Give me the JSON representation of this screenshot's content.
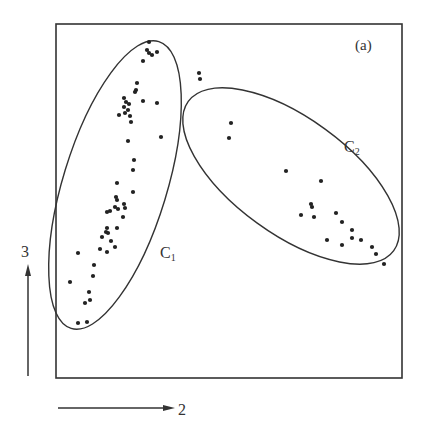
{
  "chart_data": {
    "type": "scatter",
    "title": "",
    "panel_label": "(a)",
    "xlabel": "2",
    "ylabel": "3",
    "axis_style": "arrows outside frame, no ticks",
    "grid": false,
    "legend": null,
    "frame": {
      "left": 56,
      "top": 24,
      "right": 402,
      "bottom": 378
    },
    "clusters": [
      {
        "name": "C₁",
        "label_main": "C",
        "label_sub": "1",
        "label_pos": [
          160,
          258
        ],
        "ellipse": {
          "cx": 115,
          "cy": 185,
          "rx": 52,
          "ry": 150,
          "rotate": 17
        },
        "points": [
          [
            149,
            42
          ],
          [
            147,
            50
          ],
          [
            149,
            53
          ],
          [
            152,
            55
          ],
          [
            157,
            52
          ],
          [
            143,
            61
          ],
          [
            137,
            83
          ],
          [
            136,
            90
          ],
          [
            135,
            92
          ],
          [
            124,
            98
          ],
          [
            126,
            102
          ],
          [
            129,
            104
          ],
          [
            124,
            107
          ],
          [
            128,
            110
          ],
          [
            125,
            113
          ],
          [
            119,
            115
          ],
          [
            130,
            116
          ],
          [
            143,
            101
          ],
          [
            157,
            103
          ],
          [
            131,
            122
          ],
          [
            161,
            137
          ],
          [
            128,
            141
          ],
          [
            134,
            160
          ],
          [
            133,
            170
          ],
          [
            117,
            183
          ],
          [
            133,
            192
          ],
          [
            116,
            197
          ],
          [
            117,
            200
          ],
          [
            115,
            207
          ],
          [
            107,
            212
          ],
          [
            110,
            211
          ],
          [
            118,
            209
          ],
          [
            124,
            204
          ],
          [
            125,
            208
          ],
          [
            123,
            217
          ],
          [
            107,
            228
          ],
          [
            106,
            232
          ],
          [
            102,
            237
          ],
          [
            108,
            233
          ],
          [
            117,
            228
          ],
          [
            111,
            241
          ],
          [
            115,
            247
          ],
          [
            100,
            249
          ],
          [
            107,
            252
          ],
          [
            78,
            253
          ],
          [
            94,
            265
          ],
          [
            93,
            276
          ],
          [
            70,
            282
          ],
          [
            89,
            292
          ],
          [
            90,
            300
          ],
          [
            85,
            303
          ],
          [
            78,
            323
          ],
          [
            87,
            322
          ]
        ]
      },
      {
        "name": "C₂",
        "label_main": "C",
        "label_sub": "2",
        "label_pos": [
          344,
          152
        ],
        "ellipse": {
          "cx": 291,
          "cy": 176,
          "rx": 127,
          "ry": 58,
          "rotate": 36
        },
        "points": [
          [
            199,
            73
          ],
          [
            200,
            79
          ],
          [
            231,
            123
          ],
          [
            229,
            138
          ],
          [
            286,
            171
          ],
          [
            321,
            181
          ],
          [
            311,
            204
          ],
          [
            312,
            207
          ],
          [
            314,
            217
          ],
          [
            301,
            215
          ],
          [
            336,
            213
          ],
          [
            342,
            222
          ],
          [
            352,
            230
          ],
          [
            327,
            240
          ],
          [
            342,
            245
          ],
          [
            352,
            238
          ],
          [
            361,
            240
          ],
          [
            372,
            247
          ],
          [
            376,
            254
          ],
          [
            384,
            264
          ]
        ]
      }
    ]
  }
}
